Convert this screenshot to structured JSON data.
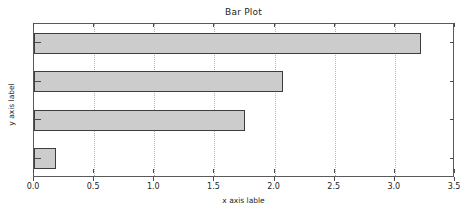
{
  "chart_data": {
    "type": "bar",
    "orientation": "horizontal",
    "title": "Bar Plot",
    "xlabel": "x axis lable",
    "ylabel": "y axis label",
    "categories": [
      "A",
      "B",
      "C",
      "D"
    ],
    "values": [
      0.18,
      1.75,
      2.07,
      3.22
    ],
    "xlim": [
      0.0,
      3.5
    ],
    "xticks": [
      "0.0",
      "0.5",
      "1.0",
      "1.5",
      "2.0",
      "2.5",
      "3.0",
      "3.5"
    ],
    "xtick_values": [
      0.0,
      0.5,
      1.0,
      1.5,
      2.0,
      2.5,
      3.0,
      3.5
    ],
    "grid": "vertical-dotted",
    "legend": null,
    "bar_color": "#cccccc",
    "bar_edge_color": "#3d3d3d",
    "axes_color": "#5a5a5a",
    "grid_color": "#b5b5b5",
    "text_color": "#262626"
  }
}
